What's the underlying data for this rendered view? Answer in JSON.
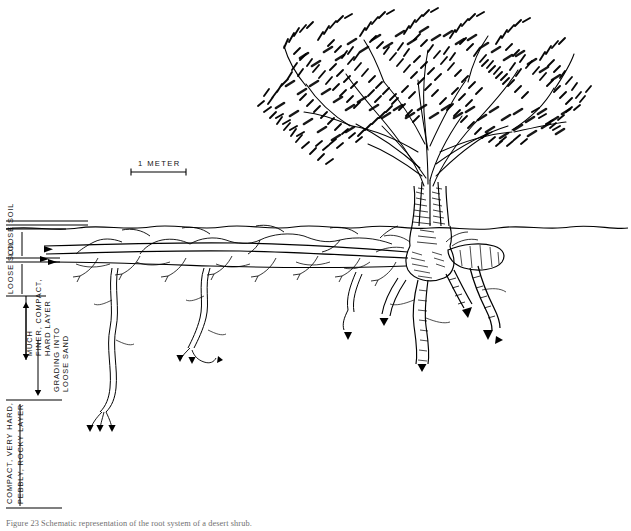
{
  "figure": {
    "kind": "root-system-profile-diagram",
    "medium": "pen-and-ink line drawing",
    "background_color": "#ffffff",
    "ink_color": "#000000",
    "caption": "Figure 23 Schematic representation of the root system of a desert shrub."
  },
  "scale_bar": {
    "label": "1 METER",
    "x_start_px": 131,
    "x_end_px": 186,
    "y_px": 172,
    "tick_height_px": 7
  },
  "ground": {
    "label": "ground surface",
    "y_px": 228,
    "style": "wavy line spanning full width"
  },
  "soil_profile": {
    "horizons": [
      {
        "id": "loose-soil-upper",
        "label": "LOOSE SOIL",
        "top_px": 232,
        "bottom_px": 258,
        "description": "uppermost loose soil horizon"
      },
      {
        "id": "loose-soil-lower",
        "label": "LOOSE SOIL",
        "top_px": 262,
        "bottom_px": 296,
        "description": "second loose soil horizon"
      },
      {
        "id": "compact-hard-layer",
        "label": "MUCH FINER, COMPACT, HARD LAYER",
        "top_px": 296,
        "bottom_px": 360,
        "description": "much finer, compact, hard layer with double-headed extent arrow"
      },
      {
        "id": "grading-into-loose-sand",
        "label": "GRADING INTO LOOSE SAND",
        "top_px": 300,
        "bottom_px": 396,
        "description": "transition zone grading into loose sand, single arrow"
      },
      {
        "id": "compact-rocky-layer",
        "label": "COMPACT, VERY HARD, PEBBLY, ROCKY LAYER",
        "top_px": 400,
        "bottom_px": 508,
        "description": "basal compact, very hard, pebbly, rocky layer"
      }
    ]
  },
  "plant": {
    "habit": "multi-stemmed woody shrub",
    "canopy": {
      "description": "dense dark finely-divided foliage crown",
      "left_px": 262,
      "right_px": 580,
      "top_px": 8,
      "bottom_px": 150
    },
    "trunk": {
      "description": "several ascending stems converging to a swollen root crown at the soil surface",
      "crown_x_px": 430,
      "crown_y_px": 228
    },
    "roots": {
      "lateral_left": {
        "description": "long shallow horizontal lateral roots running left just below the surface with fine branchlets and arrow tips",
        "extent_x_px": 40
      },
      "lateral_right": {
        "description": "thick blunt-ended lateral root extending right below the surface",
        "extent_x_px": 505
      },
      "sinkers": {
        "description": "descending sinker roots penetrating the hard layer, terminating in arrowheads",
        "deepest_y_px": 432
      }
    }
  }
}
